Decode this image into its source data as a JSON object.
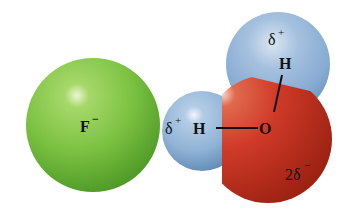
{
  "diagram": {
    "type": "molecular-interaction",
    "colors": {
      "fluoride": "#7cc242",
      "hydrogen": "#8fb3d6",
      "oxygen": "#d03a28",
      "background": "#ffffff",
      "text": "#111111"
    },
    "fluoride": {
      "symbol": "F",
      "charge": "−"
    },
    "water": {
      "oxygen": {
        "symbol": "O",
        "partial_charge": "2δ−",
        "partial_charge_coef": "2δ",
        "partial_charge_sign": "−"
      },
      "hydrogen_left": {
        "symbol": "H",
        "partial_charge": "δ+",
        "partial_charge_base": "δ",
        "partial_charge_sign": "+"
      },
      "hydrogen_top": {
        "symbol": "H",
        "partial_charge": "δ+",
        "partial_charge_base": "δ",
        "partial_charge_sign": "+"
      }
    }
  }
}
